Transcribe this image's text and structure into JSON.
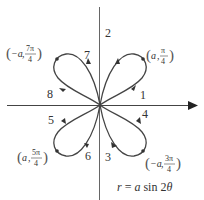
{
  "figure": {
    "equation": "r = a sin 2θ",
    "equation_parts": {
      "lhs": "r",
      "eq": " = ",
      "a": "a",
      "fn": " sin 2",
      "theta": "θ"
    },
    "colors": {
      "axis": "#555555",
      "curve": "#444444",
      "text": "#333333"
    },
    "curve_labels": [
      "1",
      "2",
      "3",
      "4",
      "5",
      "6",
      "7",
      "8"
    ],
    "points": [
      {
        "id": "q1",
        "r": "a",
        "theta_num": "π",
        "theta_den": "4",
        "label": "(a, π/4)"
      },
      {
        "id": "q4",
        "r": "−a",
        "theta_num": "3π",
        "theta_den": "4",
        "label": "(−a, 3π/4)"
      },
      {
        "id": "q3",
        "r": "a",
        "theta_num": "5π",
        "theta_den": "4",
        "label": "(a, 5π/4)"
      },
      {
        "id": "q2",
        "r": "−a",
        "theta_num": "7π",
        "theta_den": "4",
        "label": "(−a, 7π/4)"
      }
    ]
  }
}
